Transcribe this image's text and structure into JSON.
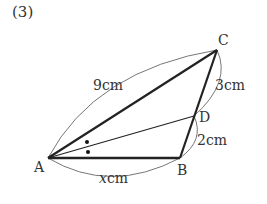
{
  "problem": {
    "number": "(3)"
  },
  "points": {
    "A": {
      "label": "A",
      "x": 48,
      "y": 158
    },
    "B": {
      "label": "B",
      "x": 180,
      "y": 158
    },
    "C": {
      "label": "C",
      "x": 217,
      "y": 50
    },
    "D": {
      "label": "D",
      "x": 194,
      "y": 116
    }
  },
  "segments": {
    "AC": {
      "length_label": "9cm",
      "value": "9",
      "unit": "cm"
    },
    "CD": {
      "length_label": "3cm",
      "value": "3",
      "unit": "cm"
    },
    "DB": {
      "length_label": "2cm",
      "value": "2",
      "unit": "cm"
    },
    "AB": {
      "length_label": "xcm",
      "value": "x",
      "unit": "cm"
    }
  },
  "annotations": {
    "angle_bisector": "AD bisects angle BAC (marked with two dots)"
  },
  "colors": {
    "line": "#222222",
    "arc": "#666666",
    "text": "#333333"
  }
}
